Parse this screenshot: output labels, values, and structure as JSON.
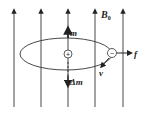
{
  "diagram": {
    "field_label": "B",
    "field_subscript": "0",
    "moment_label": "m",
    "delta_moment_label": "Δm",
    "force_label": "f",
    "velocity_label": "v",
    "positive_charge": "+",
    "negative_charge": "−",
    "field_line_x": [
      14,
      41,
      68,
      95,
      123
    ]
  }
}
